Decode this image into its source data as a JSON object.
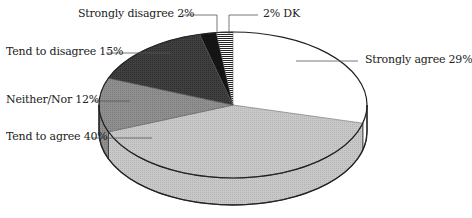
{
  "chart_data": {
    "type": "pie",
    "style": "3d-exploded-none",
    "title": "",
    "categories": [
      "Strongly agree",
      "Tend to agree",
      "Neither/Nor",
      "Tend to disagree",
      "Strongly disagree",
      "DK"
    ],
    "values": [
      29,
      40,
      12,
      15,
      2,
      2
    ],
    "unit": "%",
    "labels": [
      "Strongly agree 29%",
      "Tend to agree 40%",
      "Neither/Nor 12%",
      "Tend to disagree 15%",
      "Strongly disagree 2%",
      "2% DK"
    ],
    "colors": [
      "#ffffff",
      "#c4c4c4",
      "#8e8e8e",
      "#3c3c3c",
      "#111111",
      "#ffffff"
    ],
    "legend": "none (leader-line labels)"
  },
  "labels": {
    "strongly_agree": "Strongly agree 29%",
    "tend_to_agree": "Tend to agree 40%",
    "neither_nor": "Neither/Nor 12%",
    "tend_to_disagree": "Tend to disagree 15%",
    "strongly_disagree": "Strongly disagree 2%",
    "dk": "2% DK"
  }
}
